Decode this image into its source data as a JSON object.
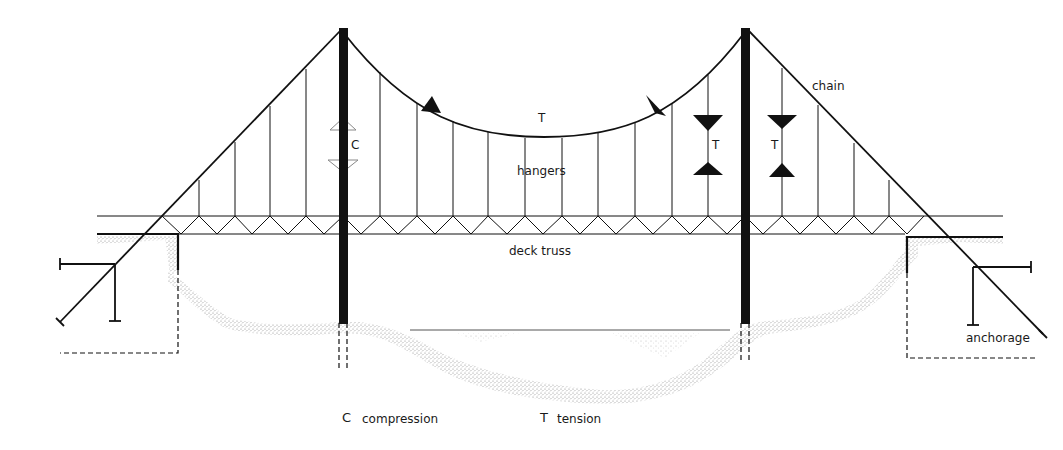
{
  "labels": {
    "chain": "chain",
    "hangers": "hangers",
    "deck_truss": "deck truss",
    "anchorage": "anchorage",
    "tower_force": "C",
    "cable_force": "T",
    "hanger_force_left": "T",
    "hanger_force_right": "T"
  },
  "legend": [
    {
      "symbol": "C",
      "meaning": "compression"
    },
    {
      "symbol": "T",
      "meaning": "tension"
    }
  ],
  "colors": {
    "ink": "#111111",
    "ground_stipple": "#9a9a9a",
    "compression_arrow_outline": "#888888"
  },
  "structure": {
    "towers": [
      {
        "x": 343,
        "top": 28,
        "bottom": 323
      },
      {
        "x": 745,
        "top": 28,
        "bottom": 323
      }
    ],
    "deck": {
      "top_y": 216,
      "bottom_y": 234,
      "x_start": 97,
      "x_end": 1003
    },
    "main_cable": {
      "start": [
        343,
        32
      ],
      "end": [
        745,
        32
      ],
      "low_y": 137
    },
    "hangers_x": [
      199,
      235,
      270,
      306,
      380,
      417,
      453,
      488,
      525,
      562,
      598,
      635,
      672,
      708,
      782,
      818,
      854,
      889
    ]
  }
}
